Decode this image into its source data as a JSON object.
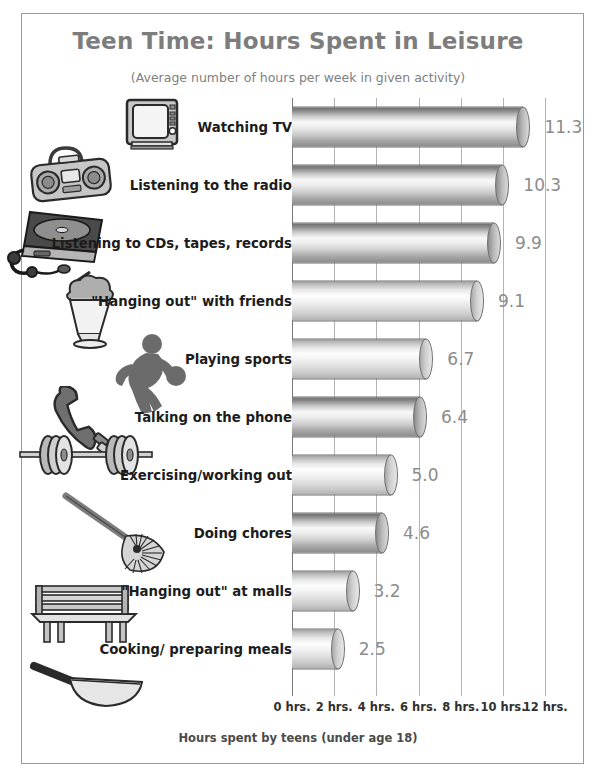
{
  "chart_data": {
    "type": "bar",
    "orientation": "horizontal",
    "title": "Teen Time: Hours Spent in Leisure",
    "subtitle": "(Average number of hours per week in given activity)",
    "xlabel": "Hours spent by teens (under age 18)",
    "ylabel": "",
    "xlim": [
      0,
      13
    ],
    "grid": true,
    "legend": "none",
    "tick_labels": [
      "0 hrs.",
      "2 hrs.",
      "4 hrs.",
      "6 hrs.",
      "8 hrs.",
      "10 hrs.",
      "12 hrs."
    ],
    "tick_values": [
      0,
      2,
      4,
      6,
      8,
      10,
      12
    ],
    "categories": [
      "Watching TV",
      "Listening to the radio",
      "Listening to CDs, tapes, records",
      "\"Hanging out\" with friends",
      "Playing sports",
      "Talking on the phone",
      "Exercising/working out",
      "Doing chores",
      "\"Hanging out\" at malls",
      "Cooking/ preparing meals"
    ],
    "values": [
      11.3,
      10.3,
      9.9,
      9.1,
      6.7,
      6.4,
      5.0,
      4.6,
      3.2,
      2.5
    ],
    "value_labels": [
      "11.3",
      "10.3",
      "9.9",
      "9.1",
      "6.7",
      "6.4",
      "5.0",
      "4.6",
      "3.2",
      "2.5"
    ],
    "icons": [
      "television-icon",
      "boombox-icon",
      "cd-player-icon",
      "milkshake-icon",
      "basketball-player-icon",
      "telephone-icon",
      "barbell-icon",
      "rake-icon",
      "bench-icon",
      "frying-pan-icon"
    ],
    "bar_shading": [
      "dark",
      "dark",
      "dark",
      "light",
      "light",
      "dark",
      "light",
      "dark",
      "light",
      "light"
    ],
    "colors": {
      "title": "#7d7d7d",
      "subtitle": "#808080",
      "value_label": "#8c8c8c",
      "category_label": "#1c1c1c",
      "gridline": "#b4b4b4",
      "axis": "#7a7a7a",
      "frame": "#9a9a9a",
      "background": "#ffffff"
    }
  }
}
